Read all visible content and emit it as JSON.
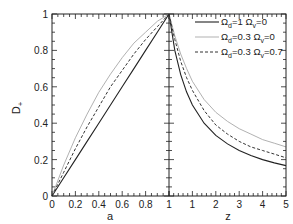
{
  "chart_data": {
    "type": "line",
    "title": "",
    "ylabel": "D+",
    "ylabel_main": "D",
    "ylabel_sub": "+",
    "panels": [
      {
        "name": "left",
        "xlabel": "a",
        "xlim": [
          0,
          1
        ],
        "ylim": [
          0,
          1
        ],
        "xticks": [
          "0",
          "0.2",
          "0.4",
          "0.6",
          "0.8",
          "1"
        ],
        "yticks": [
          "0",
          "0.2",
          "0.4",
          "0.6",
          "0.8",
          "1"
        ],
        "x": [
          0,
          0.1,
          0.2,
          0.3,
          0.4,
          0.5,
          0.6,
          0.7,
          0.8,
          0.9,
          1.0
        ],
        "series": [
          {
            "name": "Ωd=1 Ωv=0",
            "style": "solid",
            "color": "#222222",
            "values": [
              0,
              0.1,
              0.2,
              0.3,
              0.4,
              0.5,
              0.6,
              0.7,
              0.8,
              0.9,
              1.0
            ]
          },
          {
            "name": "Ωd=0.3 Ωv=0",
            "style": "dotted-light",
            "color": "#9a9a9a",
            "values": [
              0,
              0.17,
              0.32,
              0.45,
              0.57,
              0.67,
              0.76,
              0.84,
              0.9,
              0.96,
              1.0
            ]
          },
          {
            "name": "Ωd=0.3 Ωv=0.7",
            "style": "dashed",
            "color": "#333333",
            "values": [
              0,
              0.13,
              0.26,
              0.38,
              0.49,
              0.6,
              0.69,
              0.78,
              0.86,
              0.93,
              1.0
            ]
          }
        ]
      },
      {
        "name": "right",
        "xlabel": "z",
        "xlim": [
          0,
          5
        ],
        "ylim": [
          0,
          1
        ],
        "xticks": [
          "1",
          "1",
          "2",
          "3",
          "4",
          "5"
        ],
        "x": [
          0,
          0.25,
          0.5,
          0.75,
          1,
          1.5,
          2,
          2.5,
          3,
          3.5,
          4,
          4.5,
          5
        ],
        "series": [
          {
            "name": "Ωd=1 Ωv=0",
            "style": "solid",
            "color": "#222222",
            "values": [
              1.0,
              0.8,
              0.667,
              0.571,
              0.5,
              0.4,
              0.333,
              0.286,
              0.25,
              0.222,
              0.2,
              0.182,
              0.167
            ]
          },
          {
            "name": "Ωd=0.3 Ωv=0",
            "style": "dotted-light",
            "color": "#9a9a9a",
            "values": [
              1.0,
              0.88,
              0.78,
              0.7,
              0.63,
              0.53,
              0.46,
              0.41,
              0.37,
              0.34,
              0.31,
              0.29,
              0.27
            ]
          },
          {
            "name": "Ωd=0.3 Ωv=0.7",
            "style": "dashed",
            "color": "#333333",
            "values": [
              1.0,
              0.86,
              0.74,
              0.65,
              0.58,
              0.47,
              0.39,
              0.34,
              0.3,
              0.27,
              0.25,
              0.23,
              0.21
            ]
          }
        ]
      }
    ],
    "legend": {
      "position": "upper-right",
      "entries": [
        {
          "main": "Ω",
          "sub1": "d",
          "text1": "=1 Ω",
          "sub2": "v",
          "text2": "=0",
          "style": "solid"
        },
        {
          "main": "Ω",
          "sub1": "d",
          "text1": "=0.3 Ω",
          "sub2": "v",
          "text2": "=0",
          "style": "dotted-light"
        },
        {
          "main": "Ω",
          "sub1": "d",
          "text1": "=0.3 Ω",
          "sub2": "v",
          "text2": "=0.7",
          "style": "dashed"
        }
      ]
    },
    "grid": false
  }
}
